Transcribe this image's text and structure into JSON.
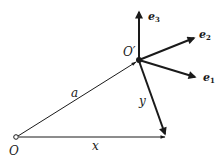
{
  "diagram": {
    "type": "vector-frame-diagram",
    "points": {
      "origin": {
        "label": "O",
        "x": 16,
        "y": 137
      },
      "origin_prime": {
        "label": "O′",
        "x": 139,
        "y": 60
      }
    },
    "vectors": [
      {
        "id": "a",
        "label": "a",
        "from": "O",
        "to": "O′",
        "weight": "thin"
      },
      {
        "id": "x",
        "label": "x",
        "from": "O",
        "to": "tip",
        "weight": "thin"
      },
      {
        "id": "y",
        "label": "y",
        "from": "O′",
        "to": "tip",
        "weight": "bold"
      },
      {
        "id": "e1",
        "label": "e",
        "subscript": "1",
        "from": "O′",
        "weight": "bold"
      },
      {
        "id": "e2",
        "label": "e",
        "subscript": "2",
        "from": "O′",
        "weight": "bold"
      },
      {
        "id": "e3",
        "label": "e",
        "subscript": "3",
        "from": "O′",
        "weight": "bold"
      }
    ],
    "labels": {
      "O": "O",
      "O_prime": "O′",
      "a": "a",
      "x": "x",
      "y": "y",
      "e": "e",
      "sub1": "1",
      "sub2": "2",
      "sub3": "3"
    },
    "colors": {
      "ink": "#1a1a1a",
      "background": "#ffffff"
    }
  }
}
